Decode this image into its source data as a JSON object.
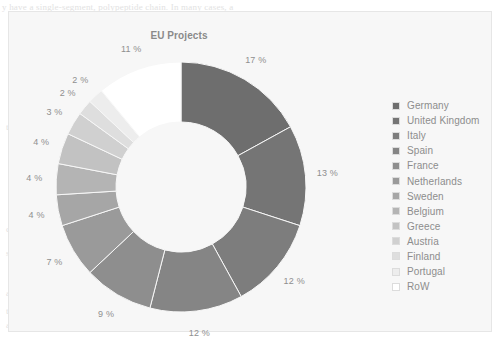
{
  "page_bleed": [
    {
      "text": "y have a single-segment, polypeptide chain. In many cases, a",
      "x": 2,
      "y": 2
    },
    {
      "text": "the protein of a particular a protein may be",
      "x": 6,
      "y": 122
    },
    {
      "text": "A common type of protein",
      "x": 150,
      "y": 186
    },
    {
      "text": "the structure of the protein determines",
      "x": 146,
      "y": 198
    },
    {
      "text": "in the cell and the protein",
      "x": 150,
      "y": 210
    },
    {
      "text": "conformation of a polypeptide chain in a",
      "x": 6,
      "y": 224
    },
    {
      "text": "structure with stabilized by hydrogen bonds",
      "x": 6,
      "y": 248
    },
    {
      "text": "and also the residues will be stabilized in the",
      "x": 6,
      "y": 288
    },
    {
      "text": "the side chains of the amino acids",
      "x": 6,
      "y": 306
    },
    {
      "text": "a protein the structure is in a cell",
      "x": 6,
      "y": 320
    }
  ],
  "chart_panel": {
    "title": "EU Projects",
    "background_color": "#f7f7f7",
    "border_color": "#e6e6e6"
  },
  "legend": {
    "position": "right",
    "items": [
      {
        "label": "Germany",
        "color": "#6e6e6e"
      },
      {
        "label": "United Kingdom",
        "color": "#757575"
      },
      {
        "label": "Italy",
        "color": "#7d7d7d"
      },
      {
        "label": "Spain",
        "color": "#858585"
      },
      {
        "label": "France",
        "color": "#8e8e8e"
      },
      {
        "label": "Netherlands",
        "color": "#9a9a9a"
      },
      {
        "label": "Sweden",
        "color": "#a6a6a6"
      },
      {
        "label": "Belgium",
        "color": "#b4b4b4"
      },
      {
        "label": "Greece",
        "color": "#c2c2c2"
      },
      {
        "label": "Austria",
        "color": "#d0d0d0"
      },
      {
        "label": "Finland",
        "color": "#dedede"
      },
      {
        "label": "Portugal",
        "color": "#ededed"
      },
      {
        "label": "RoW",
        "color": "#ffffff"
      }
    ]
  },
  "chart_data": {
    "type": "pie",
    "variant": "donut",
    "title": "EU Projects",
    "start_angle_deg": 0,
    "direction": "clockwise",
    "hole_ratio": 0.52,
    "value_suffix": " %",
    "legend_position": "right",
    "categories": [
      "Germany",
      "United Kingdom",
      "Italy",
      "Spain",
      "France",
      "Netherlands",
      "Sweden",
      "Belgium",
      "Greece",
      "Austria",
      "Finland",
      "Portugal",
      "RoW"
    ],
    "values": [
      17,
      13,
      12,
      12,
      9,
      7,
      4,
      4,
      4,
      3,
      2,
      2,
      11
    ],
    "labels": [
      "17 %",
      "13 %",
      "12 %",
      "12 %",
      "9 %",
      "7 %",
      "4 %",
      "4 %",
      "4 %",
      "3 %",
      "2 %",
      "2 %",
      "11 %"
    ],
    "colors": [
      "#6e6e6e",
      "#757575",
      "#7d7d7d",
      "#858585",
      "#8e8e8e",
      "#9a9a9a",
      "#a6a6a6",
      "#b4b4b4",
      "#c2c2c2",
      "#d0d0d0",
      "#dedede",
      "#ededed",
      "#ffffff"
    ],
    "label_color": "#8f8f8f",
    "slice_border_color": "#f7f7f7"
  }
}
